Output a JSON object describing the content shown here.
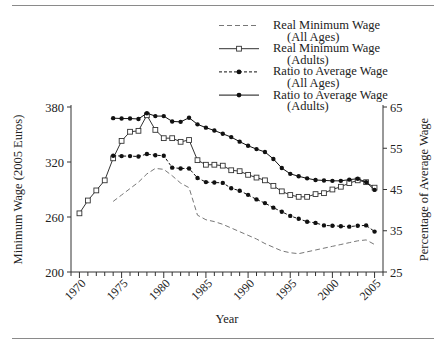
{
  "figure": {
    "top_rule": true,
    "bottom_rule": true,
    "background_color": "#ffffff",
    "line_color": "#8a8a8a"
  },
  "chart_data": {
    "type": "line",
    "title": "",
    "xlabel": "Year",
    "ylabel": "Minimum Wage (2005 Euros)",
    "y2label": "Percentage of Average Wage",
    "xlim": [
      1969,
      2006
    ],
    "ylim": [
      200,
      380
    ],
    "y2lim": [
      25,
      65
    ],
    "xticks": [
      1970,
      1975,
      1980,
      1985,
      1990,
      1995,
      2000,
      2005
    ],
    "xtick_labels": [
      "1970",
      "1975",
      "1980",
      "1985",
      "1990",
      "1995",
      "2000",
      "2005"
    ],
    "xminor_step": 1,
    "yticks": [
      200,
      260,
      320,
      380
    ],
    "ytick_labels": [
      "200",
      "260",
      "320",
      "380"
    ],
    "y2ticks": [
      25,
      35,
      45,
      55,
      65
    ],
    "y2tick_labels": [
      "25",
      "35",
      "45",
      "55",
      "65"
    ],
    "grid": false,
    "legend_position": "top-center",
    "series": [
      {
        "name": "Real Minimum Wage (All Ages)",
        "legend_line1": "Real Minimum Wage",
        "legend_line2": "(All Ages)",
        "axis": "left",
        "style": "dashed",
        "marker": "none",
        "color": "#777777",
        "x": [
          1974,
          1975,
          1976,
          1977,
          1978,
          1979,
          1980,
          1981,
          1982,
          1983,
          1984,
          1985,
          1986,
          1987,
          1988,
          1989,
          1990,
          1991,
          1992,
          1993,
          1994,
          1995,
          1996,
          1997,
          1998,
          1999,
          2000,
          2001,
          2002,
          2003,
          2004,
          2005
        ],
        "y": [
          277,
          284,
          291,
          298,
          307,
          313,
          312,
          305,
          297,
          292,
          262,
          257,
          255,
          252,
          248,
          244,
          240,
          236,
          231,
          227,
          223,
          221,
          220,
          222,
          224,
          226,
          228,
          230,
          232,
          234,
          235,
          230
        ]
      },
      {
        "name": "Real Minimum Wage (Adults)",
        "legend_line1": "Real Minimum Wage",
        "legend_line2": "(Adults)",
        "axis": "left",
        "style": "solid",
        "marker": "open-square",
        "color": "#333333",
        "x": [
          1970,
          1971,
          1972,
          1973,
          1974,
          1975,
          1976,
          1977,
          1978,
          1979,
          1980,
          1981,
          1982,
          1983,
          1984,
          1985,
          1986,
          1987,
          1988,
          1989,
          1990,
          1991,
          1992,
          1993,
          1994,
          1995,
          1996,
          1997,
          1998,
          1999,
          2000,
          2001,
          2002,
          2003,
          2004,
          2005
        ],
        "y": [
          264,
          278,
          289,
          300,
          324,
          343,
          353,
          354,
          371,
          355,
          346,
          346,
          342,
          344,
          322,
          317,
          317,
          316,
          311,
          310,
          306,
          303,
          300,
          294,
          288,
          284,
          282,
          282,
          285,
          286,
          290,
          293,
          297,
          300,
          298,
          292
        ]
      },
      {
        "name": "Ratio to Average Wage (All Ages)",
        "legend_line1": "Ratio to Average Wage",
        "legend_line2": "(All Ages)",
        "axis": "right",
        "style": "dashed",
        "marker": "filled-circle",
        "color": "#111111",
        "x": [
          1974,
          1975,
          1976,
          1977,
          1978,
          1979,
          1980,
          1981,
          1982,
          1983,
          1984,
          1985,
          1986,
          1987,
          1988,
          1989,
          1990,
          1991,
          1992,
          1993,
          1994,
          1995,
          1996,
          1997,
          1998,
          1999,
          2000,
          2001,
          2002,
          2003,
          2004,
          2005
        ],
        "y": [
          53.2,
          53.1,
          53.1,
          53.0,
          53.6,
          53.3,
          53.2,
          50.3,
          50.1,
          50.1,
          47.8,
          46.8,
          46.7,
          46.6,
          45.3,
          44.7,
          43.7,
          42.6,
          41.7,
          40.6,
          39.6,
          38.6,
          37.9,
          37.2,
          36.9,
          36.3,
          36.2,
          36.1,
          36.0,
          36.2,
          36.3,
          34.8
        ]
      },
      {
        "name": "Ratio to Average Wage (Adults)",
        "legend_line1": "Ratio to Average Wage",
        "legend_line2": "(Adults)",
        "axis": "right",
        "style": "solid",
        "marker": "filled-circle",
        "color": "#111111",
        "x": [
          1974,
          1975,
          1976,
          1977,
          1978,
          1979,
          1980,
          1981,
          1982,
          1983,
          1984,
          1985,
          1986,
          1987,
          1988,
          1989,
          1990,
          1991,
          1992,
          1993,
          1994,
          1995,
          1996,
          1997,
          1998,
          1999,
          2000,
          2001,
          2002,
          2003,
          2004,
          2005
        ],
        "y": [
          62.3,
          62.2,
          62.2,
          62.1,
          63.5,
          62.8,
          62.8,
          61.5,
          61.4,
          62.4,
          60.8,
          60.0,
          59.3,
          58.5,
          57.7,
          56.6,
          55.6,
          54.8,
          54.1,
          52.4,
          50.2,
          48.8,
          48.2,
          47.7,
          47.3,
          47.2,
          47.1,
          47.1,
          47.4,
          47.6,
          46.8,
          44.9
        ]
      }
    ]
  }
}
